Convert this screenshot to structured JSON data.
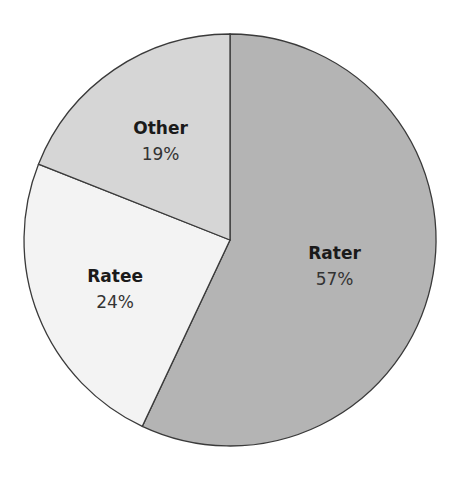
{
  "chart_data": {
    "type": "pie",
    "title": "",
    "start": "top",
    "direction": "clockwise",
    "slices": [
      {
        "label": "Rater",
        "value": 57,
        "value_label": "57%",
        "color": "#b4b4b4"
      },
      {
        "label": "Ratee",
        "value": 24,
        "value_label": "24%",
        "color": "#f3f3f3"
      },
      {
        "label": "Other",
        "value": 19,
        "value_label": "19%",
        "color": "#d6d6d6"
      }
    ],
    "legend": "none",
    "edge_color": "#3a3a3a"
  }
}
